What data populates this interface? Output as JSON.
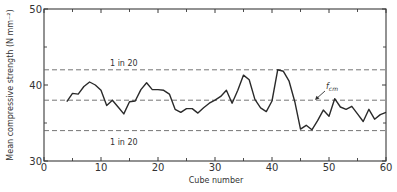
{
  "chart_data": {
    "type": "line",
    "title": "",
    "xlabel": "Cube number",
    "ylabel": "Mean compressive strength (N mm⁻²)",
    "xlim": [
      0,
      60
    ],
    "ylim": [
      30,
      50
    ],
    "x_ticks": [
      0,
      10,
      20,
      30,
      40,
      50,
      60
    ],
    "x_minor_ticks": [
      5,
      15,
      25,
      35,
      45,
      55
    ],
    "y_ticks": [
      30,
      40,
      50
    ],
    "y_minor_ticks": [
      35,
      45
    ],
    "grid": false,
    "legend": null,
    "series": [
      {
        "name": "Mean compressive strength",
        "x": [
          4,
          5,
          6,
          7,
          8,
          9,
          10,
          11,
          12,
          13,
          14,
          15,
          16,
          17,
          18,
          19,
          20,
          21,
          22,
          23,
          24,
          25,
          26,
          27,
          28,
          29,
          30,
          31,
          32,
          33,
          34,
          35,
          36,
          37,
          38,
          39,
          40,
          41,
          42,
          43,
          44,
          45,
          46,
          47,
          48,
          49,
          50,
          51,
          52,
          53,
          54,
          55,
          56,
          57,
          58,
          59,
          60
        ],
        "values": [
          37.8,
          38.9,
          38.8,
          39.8,
          40.4,
          40.0,
          39.3,
          37.3,
          38.0,
          37.1,
          36.2,
          37.8,
          37.9,
          39.4,
          40.3,
          39.4,
          39.4,
          39.3,
          38.8,
          36.8,
          36.4,
          36.9,
          36.9,
          36.3,
          37.0,
          37.6,
          38.0,
          38.5,
          39.3,
          37.6,
          39.3,
          41.3,
          40.7,
          38.1,
          37.0,
          36.5,
          37.9,
          42.0,
          41.8,
          40.5,
          37.8,
          34.2,
          34.7,
          34.1,
          35.3,
          36.7,
          35.9,
          38.2,
          37.1,
          36.8,
          37.2,
          36.2,
          35.2,
          36.8,
          35.5,
          36.1,
          36.4
        ]
      }
    ],
    "reference_lines": [
      {
        "name": "upper-limit",
        "y": 42.0,
        "style": "dashed",
        "label": "1 in 20"
      },
      {
        "name": "mean-fcm",
        "y": 38.0,
        "style": "dashed",
        "label": "f",
        "label_sub": "cm"
      },
      {
        "name": "lower-limit",
        "y": 34.0,
        "style": "dashed",
        "label": "1 in 20"
      }
    ]
  },
  "labels": {
    "upper_line": "1 in 20",
    "lower_line": "1 in 20",
    "fcm_main": "f",
    "fcm_sub": "cm",
    "xlabel": "Cube number",
    "ylabel": "Mean compressive strength (N mm⁻²)"
  },
  "colors": {
    "line": "#2a2a2a",
    "axis": "#3a3a3a",
    "dash": "#666666",
    "background": "#ffffff"
  }
}
